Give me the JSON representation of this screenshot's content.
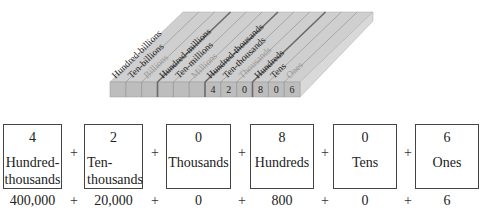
{
  "place_value_chart": {
    "columns": [
      {
        "label": "Hundred-billions",
        "digit": "",
        "group": "billions",
        "faded": false
      },
      {
        "label": "Ten-billions",
        "digit": "",
        "group": "billions",
        "faded": false
      },
      {
        "label": "Billions",
        "digit": "",
        "group": "billions",
        "faded": true
      },
      {
        "label": "Hundred-millions",
        "digit": "",
        "group": "millions",
        "faded": false
      },
      {
        "label": "Ten-millions",
        "digit": "",
        "group": "millions",
        "faded": false
      },
      {
        "label": "Millions",
        "digit": "",
        "group": "millions",
        "faded": true
      },
      {
        "label": "Hundred-thousands",
        "digit": "4",
        "group": "thousands",
        "faded": false
      },
      {
        "label": "Ten-thousands",
        "digit": "2",
        "group": "thousands",
        "faded": false
      },
      {
        "label": "Thousands",
        "digit": "0",
        "group": "thousands",
        "faded": true
      },
      {
        "label": "Hundreds",
        "digit": "8",
        "group": "ones",
        "faded": false
      },
      {
        "label": "Tens",
        "digit": "0",
        "group": "ones",
        "faded": false
      },
      {
        "label": "Ones",
        "digit": "6",
        "group": "ones",
        "faded": true
      }
    ],
    "colors": {
      "top": "#cfcfcf",
      "front": "#bdbdbd",
      "side": "#d9d9d9",
      "divider": "#8a8a8a",
      "group_divider": "#6a6a6a",
      "label": "#222222",
      "faded_label": "#9a9a9a"
    }
  },
  "expanded_form": {
    "boxes": [
      {
        "digit": "4",
        "label_line1": "Hundred-",
        "label_line2": "thousands",
        "value": "400,000"
      },
      {
        "digit": "2",
        "label_line1": "Ten-",
        "label_line2": "thousands",
        "value": "20,000"
      },
      {
        "digit": "0",
        "label_line1": "Thousands",
        "label_line2": "",
        "value": "0"
      },
      {
        "digit": "8",
        "label_line1": "Hundreds",
        "label_line2": "",
        "value": "800"
      },
      {
        "digit": "0",
        "label_line1": "Tens",
        "label_line2": "",
        "value": "0"
      },
      {
        "digit": "6",
        "label_line1": "Ones",
        "label_line2": "",
        "value": "6"
      }
    ],
    "operator": "+"
  }
}
